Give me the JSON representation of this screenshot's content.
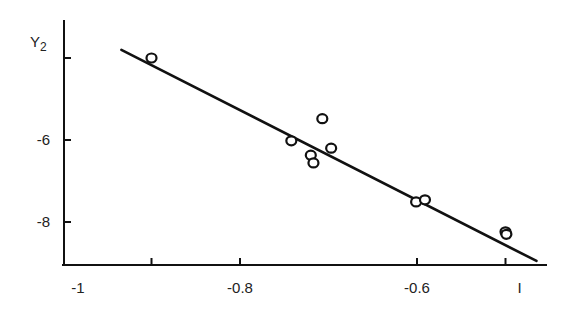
{
  "chart_data": {
    "type": "scatter",
    "title": "",
    "xlabel": "",
    "ylabel": "Y2",
    "ylabel_main": "Y",
    "ylabel_sub": "2",
    "xlim": [
      -1.0,
      -0.47
    ],
    "ylim": [
      -9.0,
      -3.0
    ],
    "grid": false,
    "legend": null,
    "x_ticks": [
      {
        "value": -1.0,
        "label": "-1"
      },
      {
        "value": -0.9,
        "label": ""
      },
      {
        "value": -0.8,
        "label": "-0.8"
      },
      {
        "value": -0.6,
        "label": "-0.6"
      },
      {
        "value": -0.5,
        "label": "I"
      }
    ],
    "y_ticks": [
      {
        "value": -4,
        "label": ""
      },
      {
        "value": -6,
        "label": "-6"
      },
      {
        "value": -8,
        "label": "-8"
      }
    ],
    "series": [
      {
        "name": "observed",
        "marker": "open-circle",
        "points": [
          {
            "x": -0.9,
            "y": -4.0
          },
          {
            "x": -0.742,
            "y": -6.02
          },
          {
            "x": -0.707,
            "y": -5.48
          },
          {
            "x": -0.72,
            "y": -6.37
          },
          {
            "x": -0.717,
            "y": -6.56
          },
          {
            "x": -0.697,
            "y": -6.2
          },
          {
            "x": -0.601,
            "y": -7.51
          },
          {
            "x": -0.591,
            "y": -7.46
          },
          {
            "x": -0.5,
            "y": -8.24
          },
          {
            "x": -0.499,
            "y": -8.3
          }
        ]
      },
      {
        "name": "fit",
        "type": "line",
        "points": [
          {
            "x": -0.934,
            "y": -3.8
          },
          {
            "x": -0.465,
            "y": -8.95
          }
        ]
      }
    ]
  }
}
